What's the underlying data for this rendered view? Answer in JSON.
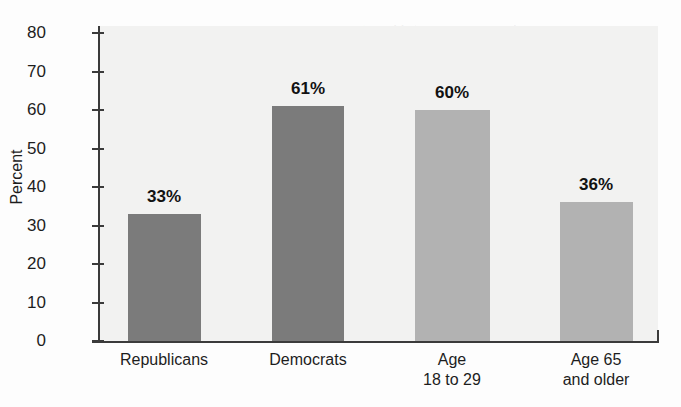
{
  "chart_data": {
    "type": "bar",
    "title": "",
    "xlabel": "",
    "ylabel": "Percent",
    "ylim": [
      0,
      80
    ],
    "ytick_step": 10,
    "yticks": [
      80,
      70,
      60,
      50,
      40,
      30,
      20,
      10,
      0
    ],
    "ytick_labels": [
      "80",
      "70",
      "60",
      "50",
      "40",
      "30",
      "20",
      "10",
      "0"
    ],
    "grid": false,
    "legend": "none",
    "categories": [
      "Republicans",
      "Democrats",
      "Age 18 to 29",
      "Age 65 and older"
    ],
    "category_label_lines": [
      [
        "Republicans"
      ],
      [
        "Democrats"
      ],
      [
        "Age",
        "18 to 29"
      ],
      [
        "Age 65",
        "and older"
      ]
    ],
    "values": [
      33,
      61,
      60,
      36
    ],
    "value_labels": [
      "33%",
      "61%",
      "60%",
      "36%"
    ],
    "bar_colors": [
      "#7b7b7b",
      "#7b7b7b",
      "#b2b2b2",
      "#b2b2b2"
    ]
  },
  "colors": {
    "bar_dark": "#7b7b7b",
    "bar_light": "#b2b2b2",
    "axis": "#3b3b3b",
    "plot_background": "#f2f2f1",
    "page_background": "#fdfdfd",
    "text": "#1d1d1d"
  },
  "ghost_text": [
    "the U.S. must act (table 4.5)",
    "respondents who thought the U.S. should act",
    "question. Only a small minority of available",
    "as more urgent and the policy",
    "the Americans had become a crisis in a few years",
    "suggested that the country should pay to",
    "in a decade, reflecting the potential",
    "should prefer that the United States be",
    "speed."
  ]
}
